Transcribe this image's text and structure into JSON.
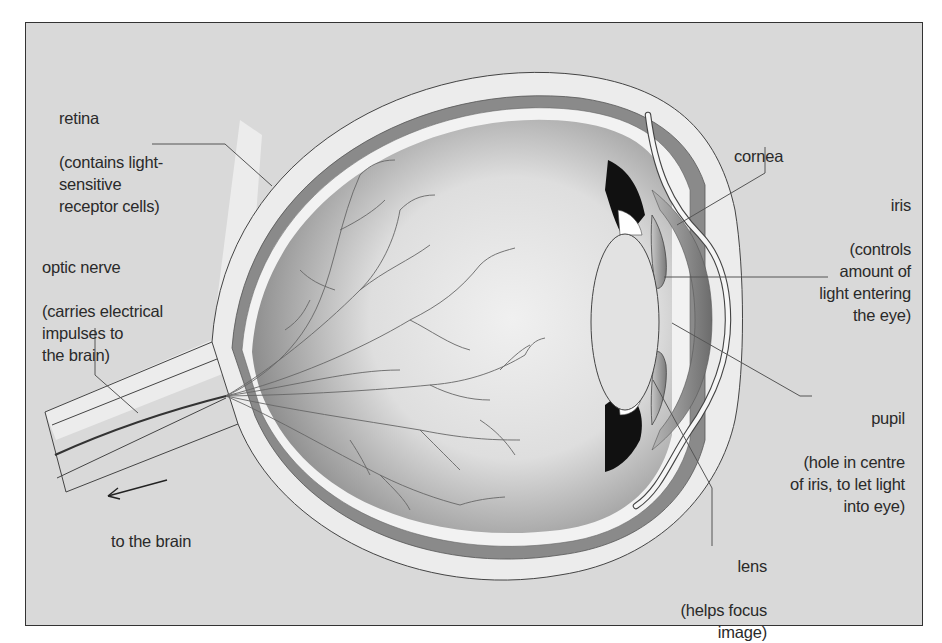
{
  "diagram": {
    "colors": {
      "background": "#d9d9d9",
      "frame_border": "#333333",
      "sclera": "#ececec",
      "choroid": "#8a8a8a",
      "vitreous_light": "#eeeeee",
      "vitreous_dark": "#9a9a9a",
      "iris_pigment": "#111111",
      "lens": "#e2e2e2",
      "leader_line": "#555555",
      "text": "#2a2a2a"
    },
    "labels": {
      "retina": {
        "title": "retina",
        "description": "(contains light-\nsensitive\nreceptor cells)"
      },
      "optic_nerve": {
        "title": "optic nerve",
        "description": "(carries electrical\nimpulses to\nthe brain)"
      },
      "to_brain": "to the brain",
      "cornea": {
        "title": "cornea"
      },
      "iris": {
        "title": "iris",
        "description": "(controls\namount of\nlight entering\nthe eye)"
      },
      "pupil": {
        "title": "pupil",
        "description": "(hole in centre\nof iris, to let light\ninto eye)"
      },
      "lens": {
        "title": "lens",
        "description": "(helps focus\nimage)"
      }
    },
    "icons": {
      "direction_arrow": "arrow-left"
    }
  }
}
